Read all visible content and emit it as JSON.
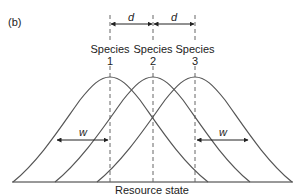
{
  "panel_label": "(b)",
  "species": [
    {
      "name": "Species",
      "number": "1",
      "x": 110
    },
    {
      "name": "Species",
      "number": "2",
      "x": 153
    },
    {
      "name": "Species",
      "number": "3",
      "x": 195
    }
  ],
  "distance_label": "d",
  "width_label": "w",
  "x_axis_label": "Resource state",
  "colors": {
    "curve": "#555555",
    "dash": "#666666",
    "arrow": "#222222",
    "text": "#222222"
  }
}
